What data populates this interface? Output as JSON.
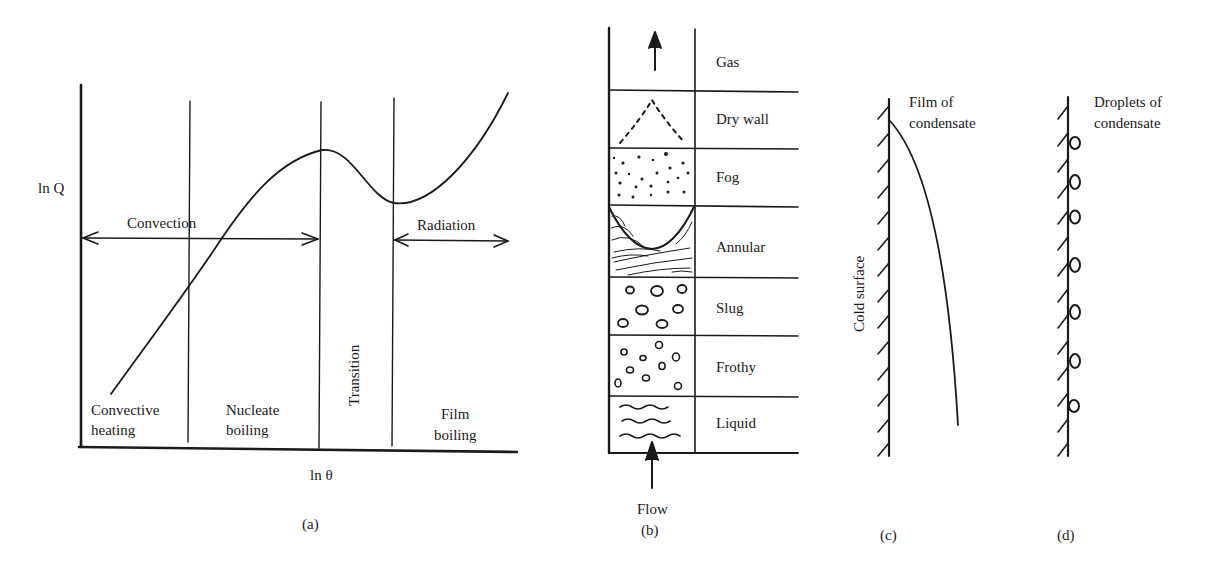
{
  "figure": {
    "panels": [
      {
        "id": "a",
        "caption": "(a)"
      },
      {
        "id": "b",
        "caption": "(b)"
      },
      {
        "id": "c",
        "caption": "(c)"
      },
      {
        "id": "d",
        "caption": "(d)"
      }
    ]
  },
  "panel_a": {
    "y_axis_label": "ln Q",
    "x_axis_label": "ln θ",
    "arrows": {
      "convection": "Convection",
      "radiation": "Radiation"
    },
    "regions": {
      "convective_1": "Convective",
      "convective_2": "heating",
      "nucleate_1": "Nucleate",
      "nucleate_2": "boiling",
      "transition": "Transition",
      "film_1": "Film",
      "film_2": "boiling"
    }
  },
  "panel_b": {
    "regimes": [
      "Gas",
      "Dry wall",
      "Fog",
      "Annular",
      "Slug",
      "Frothy",
      "Liquid"
    ],
    "flow_label": "Flow"
  },
  "panel_c": {
    "surface_label": "Cold surface",
    "film_label_1": "Film of",
    "film_label_2": "condensate"
  },
  "panel_d": {
    "droplet_label_1": "Droplets of",
    "droplet_label_2": "condensate"
  }
}
